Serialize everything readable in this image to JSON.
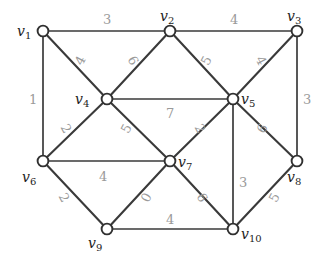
{
  "figure": {
    "kind": "weighted-undirected-graph-diagram",
    "background_color": "#ffffff",
    "edge_color": "#3a3a3a",
    "node_fill_color": "#ffffff",
    "node_stroke_color": "#303030",
    "weight_label_color": "#9a9a9a",
    "node_label_color": "#1d1d1d",
    "width": 330,
    "height": 263
  },
  "chart_data": {
    "type": "diagram",
    "title": "",
    "xlabel": "",
    "ylabel": "",
    "graph_type": "undirected weighted graph",
    "node_count": 10,
    "edge_count": 20,
    "nodes": [
      {
        "id": "v1",
        "label": "v",
        "sub": "1",
        "x": 43,
        "y": 31,
        "label_x": 17,
        "label_y": 24
      },
      {
        "id": "v2",
        "label": "v",
        "sub": "2",
        "x": 170,
        "y": 31,
        "label_x": 160,
        "label_y": 9
      },
      {
        "id": "v3",
        "label": "v",
        "sub": "3",
        "x": 297,
        "y": 31,
        "label_x": 287,
        "label_y": 9
      },
      {
        "id": "v4",
        "label": "v",
        "sub": "4",
        "x": 107,
        "y": 99,
        "label_x": 75,
        "label_y": 92
      },
      {
        "id": "v5",
        "label": "v",
        "sub": "5",
        "x": 233,
        "y": 99,
        "label_x": 241,
        "label_y": 92
      },
      {
        "id": "v6",
        "label": "v",
        "sub": "6",
        "x": 43,
        "y": 161,
        "label_x": 22,
        "label_y": 170
      },
      {
        "id": "v7",
        "label": "v",
        "sub": "7",
        "x": 170,
        "y": 161,
        "label_x": 178,
        "label_y": 155
      },
      {
        "id": "v8",
        "label": "v",
        "sub": "8",
        "x": 297,
        "y": 161,
        "label_x": 287,
        "label_y": 170
      },
      {
        "id": "v9",
        "label": "v",
        "sub": "9",
        "x": 107,
        "y": 229,
        "label_x": 88,
        "label_y": 236
      },
      {
        "id": "v10",
        "label": "v",
        "sub": "10",
        "x": 233,
        "y": 229,
        "label_x": 241,
        "label_y": 227
      }
    ],
    "edges": [
      {
        "from": "v1",
        "to": "v2",
        "weight": "3",
        "label_x": 103,
        "label_y": 13,
        "rotate": 0
      },
      {
        "from": "v2",
        "to": "v3",
        "weight": "4",
        "label_x": 230,
        "label_y": 13,
        "rotate": 0
      },
      {
        "from": "v1",
        "to": "v4",
        "weight": "4",
        "label_x": 76,
        "label_y": 54,
        "rotate": -62
      },
      {
        "from": "v1",
        "to": "v6",
        "weight": "1",
        "label_x": 29,
        "label_y": 93,
        "rotate": 0
      },
      {
        "from": "v2",
        "to": "v4",
        "weight": "6",
        "label_x": 129,
        "label_y": 54,
        "rotate": 62
      },
      {
        "from": "v2",
        "to": "v5",
        "weight": "5",
        "label_x": 202,
        "label_y": 54,
        "rotate": -62
      },
      {
        "from": "v3",
        "to": "v5",
        "weight": "4",
        "label_x": 257,
        "label_y": 54,
        "rotate": 62
      },
      {
        "from": "v3",
        "to": "v8",
        "weight": "3",
        "label_x": 303,
        "label_y": 93,
        "rotate": 0
      },
      {
        "from": "v4",
        "to": "v5",
        "weight": "7",
        "label_x": 166,
        "label_y": 107,
        "rotate": 0
      },
      {
        "from": "v4",
        "to": "v6",
        "weight": "2",
        "label_x": 62,
        "label_y": 122,
        "rotate": 62
      },
      {
        "from": "v4",
        "to": "v7",
        "weight": "5",
        "label_x": 122,
        "label_y": 122,
        "rotate": -62
      },
      {
        "from": "v5",
        "to": "v7",
        "weight": "2",
        "label_x": 196,
        "label_y": 122,
        "rotate": 62
      },
      {
        "from": "v5",
        "to": "v8",
        "weight": "6",
        "label_x": 258,
        "label_y": 122,
        "rotate": -62
      },
      {
        "from": "v5",
        "to": "v10",
        "weight": "3",
        "label_x": 239,
        "label_y": 176,
        "rotate": 0
      },
      {
        "from": "v6",
        "to": "v7",
        "weight": "4",
        "label_x": 99,
        "label_y": 170,
        "rotate": 0
      },
      {
        "from": "v6",
        "to": "v9",
        "weight": "2",
        "label_x": 60,
        "label_y": 191,
        "rotate": 62
      },
      {
        "from": "v7",
        "to": "v9",
        "weight": "0",
        "label_x": 142,
        "label_y": 191,
        "rotate": -62
      },
      {
        "from": "v7",
        "to": "v10",
        "weight": "6",
        "label_x": 198,
        "label_y": 191,
        "rotate": 62
      },
      {
        "from": "v8",
        "to": "v10",
        "weight": "5",
        "label_x": 270,
        "label_y": 191,
        "rotate": -62
      },
      {
        "from": "v9",
        "to": "v10",
        "weight": "4",
        "label_x": 166,
        "label_y": 213,
        "rotate": 0
      }
    ]
  }
}
